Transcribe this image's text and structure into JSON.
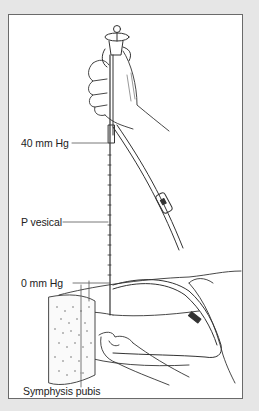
{
  "figure": {
    "labels": {
      "top_reading": "40 mm Hg",
      "vesical": "P vesical",
      "zero_reading": "0 mm Hg",
      "landmark": "Symphysis pubis"
    }
  },
  "colors": {
    "page_background": "#e6e6e6",
    "frame_background": "#ffffff",
    "frame_border": "#6a6a6a",
    "line_art": "#333333",
    "label_text": "#222222"
  }
}
